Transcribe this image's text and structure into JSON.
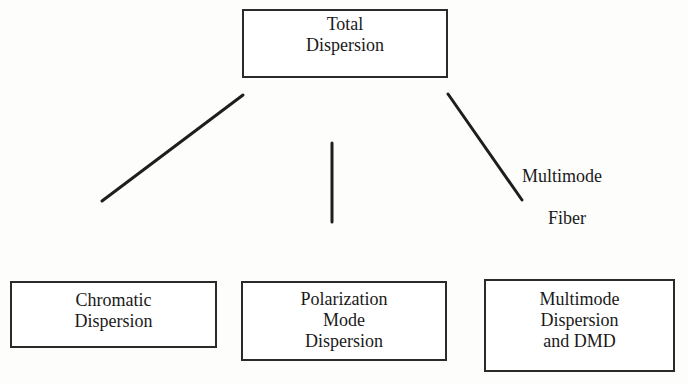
{
  "diagram": {
    "root": {
      "lines": [
        "Total",
        "Dispersion"
      ]
    },
    "children": [
      {
        "lines": [
          "Chromatic",
          "Dispersion"
        ]
      },
      {
        "lines": [
          "Polarization",
          "Mode",
          "Dispersion"
        ]
      },
      {
        "lines": [
          "Multimode",
          "Dispersion",
          "and DMD"
        ]
      }
    ],
    "edges": [
      {
        "from": "Total Dispersion",
        "to": "Chromatic Dispersion",
        "label": ""
      },
      {
        "from": "Total Dispersion",
        "to": "Polarization Mode Dispersion",
        "label": ""
      },
      {
        "from": "Total Dispersion",
        "to": "Multimode Dispersion and DMD",
        "label_lines": [
          "Multimode",
          "Fiber"
        ]
      }
    ],
    "colors": {
      "stroke": "#2a2a2a",
      "background": "#ffffff",
      "text": "#1a1a1a"
    }
  }
}
